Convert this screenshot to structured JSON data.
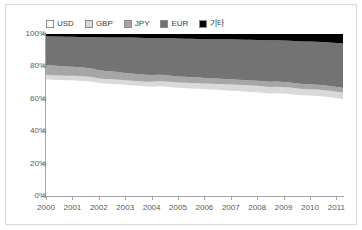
{
  "chart_data": {
    "type": "area",
    "stacked": true,
    "title": "",
    "subtitle": "",
    "xlabel": "",
    "ylabel": "",
    "xlim": [
      2000,
      2011.25
    ],
    "ylim": [
      0,
      100
    ],
    "grid": false,
    "legend_position": "top",
    "y_tick_labels": [
      "0%",
      "20%",
      "40%",
      "60%",
      "80%",
      "100%"
    ],
    "y_tick_values": [
      0,
      20,
      40,
      60,
      80,
      100
    ],
    "x_tick_labels": [
      "2000",
      "2001",
      "2002",
      "2003",
      "2004",
      "2005",
      "2006",
      "2007",
      "2008",
      "2009",
      "2010",
      "2011"
    ],
    "x_tick_values": [
      2000,
      2001,
      2002,
      2003,
      2004,
      2005,
      2006,
      2007,
      2008,
      2009,
      2010,
      2011
    ],
    "legend": [
      "USD",
      "GBP",
      "JPY",
      "EUR",
      "기타"
    ],
    "colors": {
      "USD": "#ffffff",
      "GBP": "#d9d9d9",
      "JPY": "#a6a6a6",
      "EUR": "#737373",
      "기타": "#000000"
    },
    "x": [
      2000,
      2000.25,
      2000.5,
      2000.75,
      2001,
      2001.25,
      2001.5,
      2001.75,
      2002,
      2002.25,
      2002.5,
      2002.75,
      2003,
      2003.25,
      2003.5,
      2003.75,
      2004,
      2004.25,
      2004.5,
      2004.75,
      2005,
      2005.25,
      2005.5,
      2005.75,
      2006,
      2006.25,
      2006.5,
      2006.75,
      2007,
      2007.25,
      2007.5,
      2007.75,
      2008,
      2008.25,
      2008.5,
      2008.75,
      2009,
      2009.25,
      2009.5,
      2009.75,
      2010,
      2010.25,
      2010.5,
      2010.75,
      2011,
      2011.25
    ],
    "series": [
      {
        "name": "USD",
        "values": [
          72.0,
          71.8,
          71.6,
          71.5,
          71.4,
          71.2,
          71.0,
          70.6,
          69.8,
          69.4,
          69.2,
          69.0,
          68.6,
          68.3,
          68.0,
          67.7,
          67.5,
          67.8,
          67.6,
          67.2,
          66.8,
          66.6,
          66.4,
          66.2,
          66.0,
          65.8,
          65.6,
          65.3,
          65.0,
          64.8,
          64.5,
          64.2,
          64.0,
          63.6,
          63.3,
          63.5,
          63.2,
          63.0,
          62.4,
          62.2,
          62.0,
          61.8,
          61.4,
          61.0,
          60.4,
          59.9
        ]
      },
      {
        "name": "GBP",
        "values": [
          2.8,
          2.8,
          2.8,
          2.8,
          2.8,
          2.8,
          2.8,
          2.8,
          2.8,
          2.8,
          2.8,
          2.8,
          2.8,
          2.8,
          2.8,
          2.8,
          3.0,
          3.0,
          3.1,
          3.2,
          3.2,
          3.3,
          3.3,
          3.4,
          3.4,
          3.5,
          3.6,
          3.7,
          3.8,
          3.9,
          4.0,
          4.0,
          4.0,
          4.0,
          3.9,
          3.9,
          3.9,
          3.9,
          3.9,
          3.9,
          3.9,
          3.9,
          3.9,
          3.9,
          3.9,
          3.9
        ]
      },
      {
        "name": "JPY",
        "values": [
          6.0,
          5.9,
          5.8,
          5.7,
          5.6,
          5.4,
          5.3,
          5.2,
          5.0,
          4.9,
          4.8,
          4.7,
          4.6,
          4.5,
          4.4,
          4.3,
          4.2,
          4.1,
          4.0,
          3.9,
          3.8,
          3.7,
          3.6,
          3.5,
          3.4,
          3.3,
          3.3,
          3.2,
          3.2,
          3.1,
          3.1,
          3.1,
          3.1,
          3.2,
          3.3,
          3.3,
          3.2,
          3.2,
          3.1,
          3.0,
          3.0,
          3.0,
          3.0,
          3.0,
          3.0,
          3.0
        ]
      },
      {
        "name": "EUR",
        "values": [
          17.8,
          18.0,
          18.2,
          18.3,
          18.5,
          18.8,
          19.0,
          19.5,
          20.4,
          20.8,
          21.1,
          21.4,
          21.9,
          22.2,
          22.5,
          22.8,
          22.8,
          22.6,
          22.7,
          23.0,
          23.4,
          23.5,
          23.7,
          23.8,
          24.0,
          24.2,
          24.3,
          24.5,
          24.7,
          24.8,
          24.9,
          25.1,
          25.2,
          25.4,
          25.6,
          25.4,
          25.7,
          25.8,
          26.2,
          26.3,
          26.4,
          26.5,
          26.7,
          26.9,
          27.2,
          27.5
        ]
      },
      {
        "name": "기타",
        "values": [
          1.4,
          1.5,
          1.6,
          1.7,
          1.7,
          1.8,
          1.9,
          1.9,
          2.0,
          2.1,
          2.1,
          2.1,
          2.1,
          2.2,
          2.3,
          2.4,
          2.5,
          2.5,
          2.6,
          2.7,
          2.8,
          2.9,
          3.0,
          3.1,
          3.2,
          3.2,
          3.2,
          3.3,
          3.3,
          3.4,
          3.5,
          3.6,
          3.7,
          3.8,
          3.9,
          3.9,
          4.0,
          4.1,
          4.4,
          4.6,
          4.7,
          4.8,
          5.0,
          5.2,
          5.5,
          5.7
        ]
      }
    ]
  },
  "frame": {
    "border_color": "#d9d9d9"
  },
  "axis": {
    "line_color": "#a6a6a6",
    "label_color": "#595959"
  }
}
